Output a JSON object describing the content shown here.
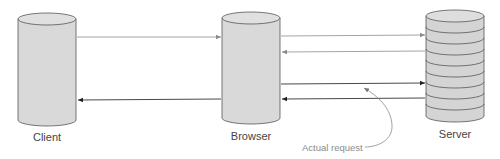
{
  "diagram": {
    "nodes": [
      {
        "id": "client",
        "label": "Client",
        "shape": "cylinder"
      },
      {
        "id": "browser",
        "label": "Browser",
        "shape": "cylinder"
      },
      {
        "id": "server",
        "label": "Server",
        "shape": "stacked-cylinder"
      }
    ],
    "edges": [
      {
        "from": "client",
        "to": "browser",
        "style": "light"
      },
      {
        "from": "browser",
        "to": "client",
        "style": "dark"
      },
      {
        "from": "browser",
        "to": "server",
        "style": "light"
      },
      {
        "from": "server",
        "to": "browser",
        "style": "light"
      },
      {
        "from": "browser",
        "to": "server",
        "style": "dark"
      },
      {
        "from": "server",
        "to": "browser",
        "style": "dark"
      }
    ],
    "callout": {
      "label": "Actual request",
      "points_to": "browser-to-server-dark"
    }
  },
  "colors": {
    "cylinder_fill": "#d9d9d9",
    "cylinder_stroke": "#555555",
    "arrow_light": "#9a9a9a",
    "arrow_dark": "#333333",
    "label_text": "#444444",
    "callout_text": "#8a8a8a"
  }
}
